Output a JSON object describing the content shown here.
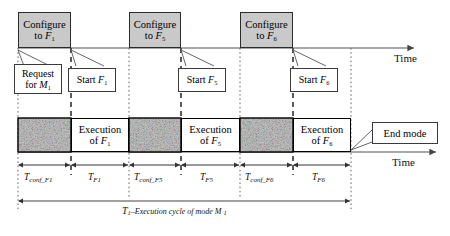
{
  "figure": {
    "type": "timing-diagram",
    "title_caption": "T1–Execution cycle of mode M1"
  },
  "axes": {
    "top_time_label": "Time",
    "bottom_time_label": "Time"
  },
  "configure_boxes": [
    {
      "line1": "Configure",
      "line2": "to F",
      "sub": "1"
    },
    {
      "line1": "Configure",
      "line2": "to F",
      "sub": "5"
    },
    {
      "line1": "Configure",
      "line2": "to F",
      "sub": "6"
    }
  ],
  "callouts": [
    {
      "line1": "Request",
      "line2": "for M",
      "sub": "1"
    },
    {
      "line1": "Start F",
      "line2": "",
      "sub": "1"
    },
    {
      "line1": "Start F",
      "line2": "",
      "sub": "5"
    },
    {
      "line1": "Start F",
      "line2": "",
      "sub": "6"
    }
  ],
  "end_mode_callout": {
    "label": "End mode"
  },
  "execution_boxes": [
    {
      "line1": "Execution",
      "line2": "of F",
      "sub": "1"
    },
    {
      "line1": "Execution",
      "line2": "of F",
      "sub": "5"
    },
    {
      "line1": "Execution",
      "line2": "of F",
      "sub": "6"
    }
  ],
  "config_segments": [
    {
      "texture": "speckle"
    },
    {
      "texture": "speckle"
    },
    {
      "texture": "speckle"
    }
  ],
  "duration_labels": [
    {
      "base": "T",
      "sub": "conf_F1"
    },
    {
      "base": "T",
      "sub": "F1"
    },
    {
      "base": "T",
      "sub": "conf_F5"
    },
    {
      "base": "T",
      "sub": "F5"
    },
    {
      "base": "T",
      "sub": "conf_F6"
    },
    {
      "base": "T",
      "sub": "F6"
    }
  ],
  "cycle_label": {
    "base": "T",
    "sub": "1",
    "dash": "–",
    "text": "Execution cycle of mode M",
    "tail_sub": "1"
  },
  "colors": {
    "configure_fill": "#c9c9c9",
    "box_border": "#2b2b2b",
    "line": "#555555",
    "noise_base": "#a8a8a8",
    "background": "#ffffff"
  }
}
